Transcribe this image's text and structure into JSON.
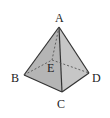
{
  "figure": {
    "type": "tetrahedron-pyramid",
    "labels": {
      "A": "A",
      "B": "B",
      "C": "C",
      "D": "D",
      "E": "E"
    },
    "colors": {
      "face_left": "#b8b8b8",
      "face_right": "#c8c8c8",
      "edge": "#333333",
      "hidden_edge": "#555555"
    }
  }
}
